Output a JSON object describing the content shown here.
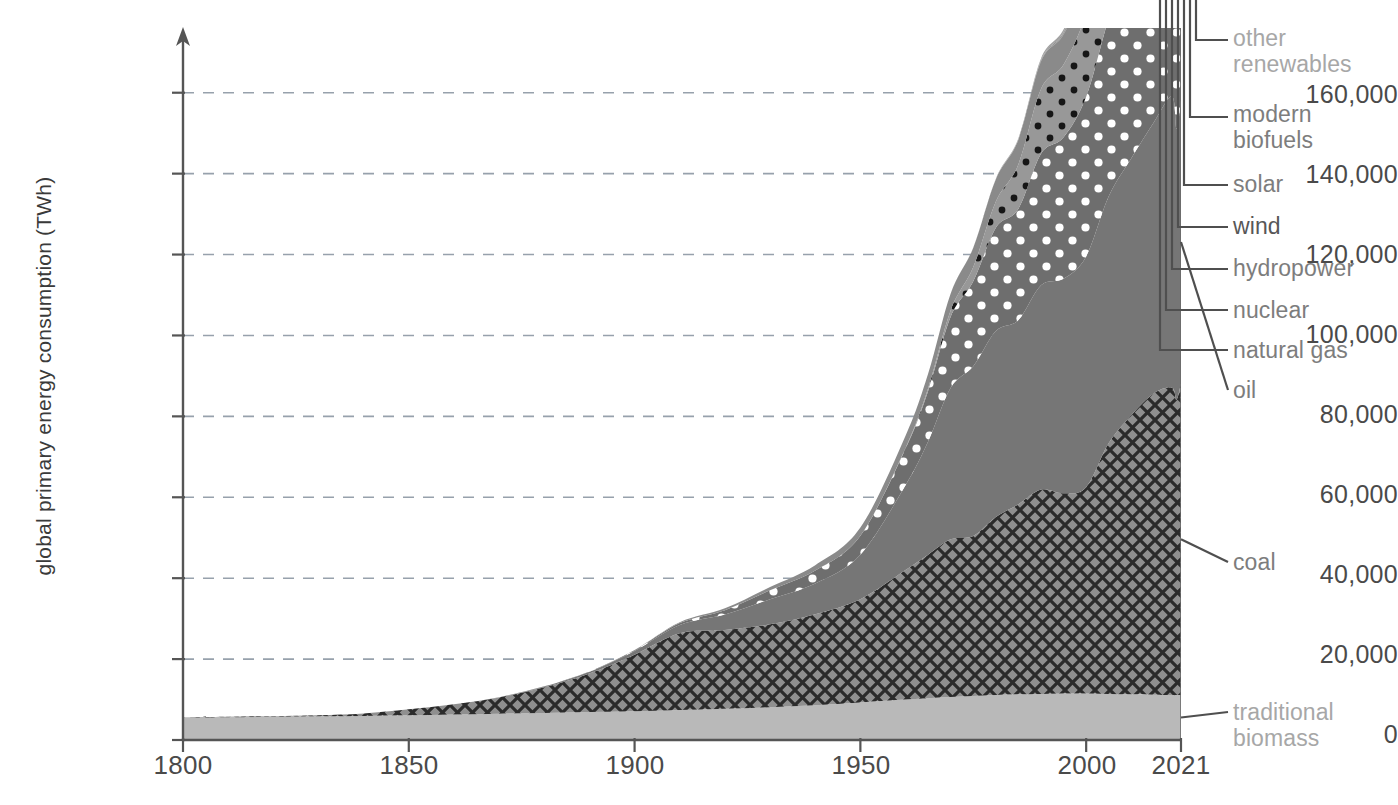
{
  "axes": {
    "y_title": "global primary energy consumption (TWh)",
    "y_ticks": [
      "160,000",
      "140,000",
      "120,000",
      "100,000",
      "80,000",
      "60,000",
      "40,000",
      "20,000",
      "0"
    ],
    "x_ticks": [
      "1800",
      "1850",
      "1900",
      "1950",
      "2000",
      "2021"
    ]
  },
  "callouts": {
    "other_renewables": "other\nrenewables",
    "modern_biofuels": "modern\nbiofuels",
    "solar": "solar",
    "wind": "wind",
    "hydropower": "hydropower",
    "nuclear": "nuclear",
    "natural_gas": "natural gas",
    "oil": "oil",
    "coal": "coal",
    "traditional_biomass": "traditional\nbiomass"
  },
  "colors": {
    "traditional_biomass": "#b9b9b9",
    "coal": "#8f8f8f",
    "coal_hatch": "#2b2b2b",
    "oil": "#767676",
    "natural_gas": "#6e6e6e",
    "natural_gas_dots": "#ffffff",
    "nuclear": "#989898",
    "nuclear_dots": "#161616",
    "hydropower": "#8a8a8a",
    "wind": "#6f6f6f",
    "solar": "#9c9c9c",
    "modern_biofuels": "#7b7b7b",
    "other_renewables": "#a2a2a2",
    "axis": "#555555",
    "grid": "#9aa3ad",
    "leader": "#4f4f4f"
  },
  "chart_data": {
    "type": "area",
    "title": "",
    "xlabel": "",
    "ylabel": "global primary energy consumption (TWh)",
    "xlim": [
      1800,
      2021
    ],
    "ylim": [
      0,
      176000
    ],
    "grid": true,
    "stacked": true,
    "legend_position": "right-callouts",
    "x": [
      1800,
      1810,
      1820,
      1830,
      1840,
      1850,
      1860,
      1870,
      1880,
      1890,
      1900,
      1910,
      1920,
      1930,
      1940,
      1950,
      1960,
      1965,
      1970,
      1975,
      1980,
      1985,
      1990,
      1995,
      2000,
      2005,
      2010,
      2015,
      2019,
      2020,
      2021
    ],
    "series": [
      {
        "name": "traditional biomass",
        "values": [
          5556,
          5647,
          5750,
          5850,
          5960,
          6100,
          6300,
          6500,
          6700,
          6900,
          7100,
          7400,
          7700,
          8100,
          8600,
          9300,
          10000,
          10300,
          10600,
          10900,
          11100,
          11300,
          11400,
          11500,
          11500,
          11400,
          11300,
          11200,
          11100,
          11100,
          11100
        ]
      },
      {
        "name": "coal",
        "values": [
          97,
          129,
          148,
          248,
          580,
          1472,
          2535,
          4009,
          6329,
          9529,
          14000,
          19000,
          19500,
          20500,
          22500,
          25500,
          32000,
          35500,
          39000,
          39500,
          44000,
          47000,
          50500,
          49500,
          51000,
          62000,
          69000,
          74500,
          76000,
          73000,
          77000
        ]
      },
      {
        "name": "oil",
        "values": [
          0,
          0,
          0,
          0,
          0,
          0,
          0,
          89,
          170,
          420,
          900,
          2000,
          3800,
          6200,
          7600,
          11000,
          21000,
          28000,
          37500,
          42000,
          46000,
          45500,
          50500,
          53000,
          57000,
          61000,
          63500,
          67000,
          72000,
          67000,
          70000
        ]
      },
      {
        "name": "natural gas",
        "values": [
          0,
          0,
          0,
          0,
          0,
          0,
          0,
          0,
          60,
          100,
          200,
          500,
          1100,
          2200,
          3200,
          4700,
          9000,
          12500,
          17500,
          21000,
          25500,
          27500,
          32500,
          35000,
          39500,
          44000,
          50500,
          54500,
          60500,
          59000,
          62500
        ]
      },
      {
        "name": "nuclear",
        "values": [
          0,
          0,
          0,
          0,
          0,
          0,
          0,
          0,
          0,
          0,
          0,
          0,
          0,
          0,
          0,
          0,
          200,
          650,
          1600,
          3500,
          6500,
          11000,
          16000,
          18000,
          20500,
          21500,
          20000,
          19000,
          20200,
          19900,
          20500
        ]
      },
      {
        "name": "hydropower",
        "values": [
          0,
          0,
          0,
          0,
          0,
          0,
          0,
          0,
          0,
          0,
          60,
          200,
          450,
          800,
          1300,
          2000,
          3000,
          3600,
          4200,
          4800,
          5500,
          6100,
          6800,
          7400,
          7800,
          8400,
          9400,
          10200,
          11000,
          11200,
          11400
        ]
      },
      {
        "name": "wind",
        "values": [
          0,
          0,
          0,
          0,
          0,
          0,
          0,
          0,
          0,
          0,
          0,
          0,
          0,
          0,
          0,
          0,
          0,
          0,
          0,
          0,
          0,
          10,
          100,
          200,
          800,
          2000,
          4200,
          9000,
          14000,
          15500,
          17500
        ]
      },
      {
        "name": "solar",
        "values": [
          0,
          0,
          0,
          0,
          0,
          0,
          0,
          0,
          0,
          0,
          0,
          0,
          0,
          0,
          0,
          0,
          0,
          0,
          0,
          0,
          0,
          0,
          10,
          20,
          40,
          200,
          900,
          4000,
          9500,
          11000,
          13000
        ]
      },
      {
        "name": "modern biofuels",
        "values": [
          0,
          0,
          0,
          0,
          0,
          0,
          0,
          0,
          0,
          0,
          0,
          0,
          0,
          0,
          0,
          0,
          0,
          0,
          0,
          0,
          30,
          90,
          200,
          350,
          700,
          1400,
          2800,
          3600,
          4400,
          4200,
          4500
        ]
      },
      {
        "name": "other renewables",
        "values": [
          0,
          0,
          0,
          0,
          0,
          0,
          0,
          0,
          0,
          0,
          0,
          0,
          0,
          0,
          0,
          0,
          0,
          0,
          0,
          50,
          120,
          250,
          450,
          700,
          1000,
          1400,
          1900,
          2500,
          3000,
          3000,
          3100
        ]
      }
    ]
  }
}
